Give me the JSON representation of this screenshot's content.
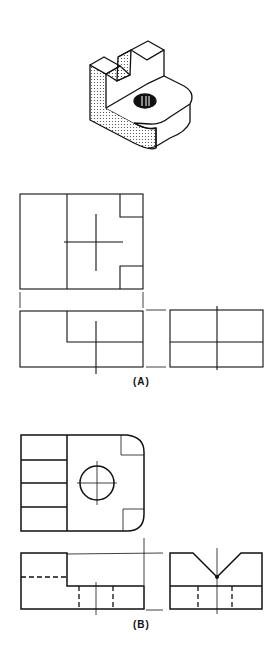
{
  "figure": {
    "labels": {
      "a": "(A)",
      "b": "(B)"
    },
    "colors": {
      "ink": "#111111",
      "shade": "#bbbbbb",
      "background": "#ffffff"
    },
    "panels": [
      {
        "id": "isometric",
        "description": "Isometric pictorial of block with V-notch upright and rounded tab with drilled hole"
      },
      {
        "id": "A",
        "views": [
          "top",
          "front",
          "right-side"
        ],
        "description": "Incomplete multiview drawing"
      },
      {
        "id": "B",
        "views": [
          "top",
          "front",
          "right-side"
        ],
        "description": "Completed multiview drawing with hidden lines"
      }
    ]
  }
}
